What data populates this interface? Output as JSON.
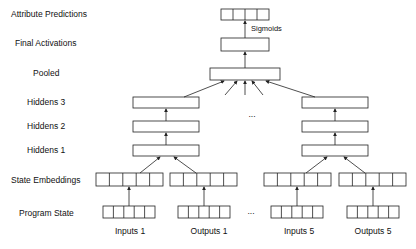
{
  "layer_labels": {
    "attribute_predictions": "Attribute Predictions",
    "final_activations": "Final Activations",
    "pooled": "Pooled",
    "hiddens3": "Hiddens 3",
    "hiddens2": "Hiddens 2",
    "hiddens1": "Hiddens 1",
    "state_embeddings": "State Embeddings",
    "program_state": "Program State"
  },
  "edge_labels": {
    "sigmoids": "Sigmoids"
  },
  "column_labels": {
    "inputs1": "Inputs 1",
    "outputs1": "Outputs 1",
    "inputs5": "Inputs 5",
    "outputs5": "Outputs 5"
  },
  "ellipsis": {
    "middle": "...",
    "bottom": "..."
  },
  "colors": {
    "stroke": "#222222",
    "text": "#111111"
  }
}
